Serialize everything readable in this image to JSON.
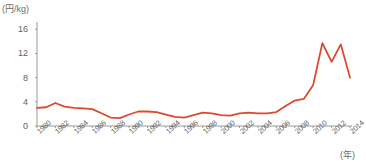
{
  "chart_data": {
    "type": "line",
    "title": "",
    "subtitle": "",
    "xlabel": "(年)",
    "ylabel": "(円/kg)",
    "x": [
      1980,
      1981,
      1982,
      1983,
      1984,
      1985,
      1986,
      1987,
      1988,
      1989,
      1990,
      1991,
      1992,
      1993,
      1994,
      1995,
      1996,
      1997,
      1998,
      1999,
      2000,
      2001,
      2002,
      2003,
      2004,
      2005,
      2006,
      2007,
      2008,
      2009,
      2010,
      2011,
      2012,
      2013,
      2014
    ],
    "series": [
      {
        "name": "価格",
        "color": "#DB4A2E",
        "values": [
          3.0,
          3.1,
          3.8,
          3.2,
          3.0,
          2.9,
          2.8,
          2.1,
          1.4,
          1.3,
          1.9,
          2.4,
          2.4,
          2.3,
          1.9,
          1.5,
          1.4,
          1.8,
          2.2,
          2.1,
          1.8,
          1.7,
          2.1,
          2.2,
          2.1,
          2.1,
          2.3,
          3.3,
          4.2,
          4.5,
          6.8,
          13.7,
          10.6,
          13.5,
          8.0
        ]
      }
    ],
    "ylim": [
      0,
      17.2
    ],
    "yticks": [
      0,
      4,
      8,
      12,
      16
    ],
    "ytick_labels": [
      "0",
      "4",
      "8",
      "12",
      "16"
    ],
    "xlim": [
      1980,
      2014
    ],
    "xticks": [
      1980,
      1982,
      1984,
      1986,
      1988,
      1990,
      1992,
      1994,
      1996,
      1998,
      2000,
      2002,
      2004,
      2006,
      2008,
      2010,
      2012,
      2014
    ],
    "xtick_labels": [
      "1980",
      "1982",
      "1984",
      "1986",
      "1988",
      "1990",
      "1992",
      "1994",
      "1996",
      "1998",
      "2000",
      "2002",
      "2004",
      "2006",
      "2008",
      "2010",
      "2012",
      "2014"
    ],
    "grid": false,
    "legend": "none",
    "axis_color": "#9a9a9a",
    "tick_text_color": "#5f5f5f",
    "background": "#ffffff"
  }
}
